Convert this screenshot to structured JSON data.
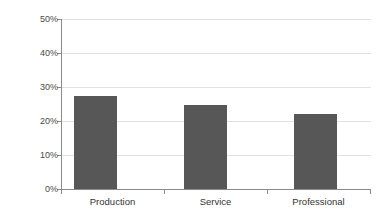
{
  "chart_data": {
    "type": "bar",
    "title": "",
    "subtitle": "",
    "xlabel": "",
    "ylabel": "",
    "categories": [
      "Production",
      "Service",
      "Professional"
    ],
    "values": [
      27.5,
      24.7,
      22.0
    ],
    "value_labels": [
      "27.5%",
      "24.7%",
      "22.0%"
    ],
    "ylim": [
      0,
      50
    ],
    "y_ticks": [
      0,
      10,
      20,
      30,
      40,
      50
    ],
    "y_tick_labels": [
      "0%",
      "10%",
      "20%",
      "30%",
      "40%",
      "50%"
    ],
    "y_tick_format": "percent",
    "grid": "horizontal",
    "legend": "none",
    "series": [
      {
        "name": "",
        "values": [
          27.5,
          24.7,
          22.0
        ]
      }
    ],
    "annotations": [],
    "colors": {
      "bar_fill": "#575757",
      "gridline": "#e2e2e2",
      "axis_line": "#8a8a8a",
      "tick_label": "#4a4a4a",
      "category_label": "#333333",
      "background": "#ffffff"
    }
  }
}
